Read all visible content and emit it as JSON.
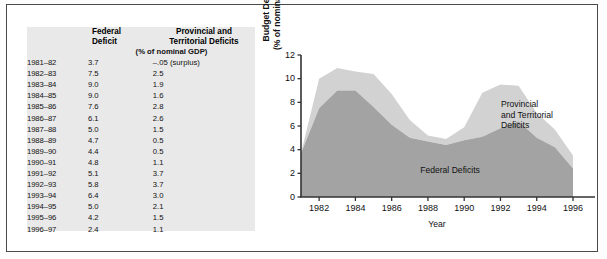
{
  "table": {
    "headers": {
      "year": "",
      "federal": "Federal\nDeficit",
      "provincial": "Provincial and\nTerritorial Deficits",
      "units": "(% of nominal GDP)"
    },
    "rows": [
      {
        "year": "1981–82",
        "federal": "3.7",
        "provincial": "–.05 (surplus)"
      },
      {
        "year": "1982–83",
        "federal": "7.5",
        "provincial": "2.5"
      },
      {
        "year": "1983–84",
        "federal": "9.0",
        "provincial": "1.9"
      },
      {
        "year": "1984–85",
        "federal": "9.0",
        "provincial": "1.6"
      },
      {
        "year": "1985–86",
        "federal": "7.6",
        "provincial": "2.8"
      },
      {
        "year": "1986–87",
        "federal": "6.1",
        "provincial": "2.6"
      },
      {
        "year": "1987–88",
        "federal": "5.0",
        "provincial": "1.5"
      },
      {
        "year": "1988–89",
        "federal": "4.7",
        "provincial": "0.5"
      },
      {
        "year": "1989–90",
        "federal": "4.4",
        "provincial": "0.5"
      },
      {
        "year": "1990–91",
        "federal": "4.8",
        "provincial": "1.1"
      },
      {
        "year": "1991–92",
        "federal": "5.1",
        "provincial": "3.7"
      },
      {
        "year": "1992–93",
        "federal": "5.8",
        "provincial": "3.7"
      },
      {
        "year": "1993–94",
        "federal": "6.4",
        "provincial": "3.0"
      },
      {
        "year": "1994–95",
        "federal": "5.0",
        "provincial": "2.1"
      },
      {
        "year": "1995–96",
        "federal": "4.2",
        "provincial": "1.5"
      },
      {
        "year": "1996–97",
        "federal": "2.4",
        "provincial": "1.1"
      }
    ]
  },
  "chart_data": {
    "type": "area",
    "stacked": true,
    "title": "",
    "xlabel": "Year",
    "ylabel": "Budget Deficits\n(% of nominal GDP)",
    "x": [
      1981,
      1982,
      1983,
      1984,
      1985,
      1986,
      1987,
      1988,
      1989,
      1990,
      1991,
      1992,
      1993,
      1994,
      1995,
      1996
    ],
    "xlim": [
      1981,
      1996
    ],
    "ylim": [
      0,
      12
    ],
    "yticks": [
      0,
      2,
      4,
      6,
      8,
      10,
      12
    ],
    "xticks": [
      1982,
      1984,
      1986,
      1988,
      1990,
      1992,
      1994,
      1996
    ],
    "grid": false,
    "legend_position": "inline-annotations",
    "series": [
      {
        "name": "Federal Deficits",
        "color": "#a3a3a3",
        "values": [
          3.7,
          7.5,
          9.0,
          9.0,
          7.6,
          6.1,
          5.0,
          4.7,
          4.4,
          4.8,
          5.1,
          5.8,
          6.4,
          5.0,
          4.2,
          2.4
        ]
      },
      {
        "name": "Provincial and Territorial Deficits",
        "color": "#d2d2d2",
        "values": [
          -0.05,
          2.5,
          1.9,
          1.6,
          2.8,
          2.6,
          1.5,
          0.5,
          0.5,
          1.1,
          3.7,
          3.7,
          3.0,
          2.1,
          1.5,
          1.1
        ]
      }
    ],
    "annotations": [
      {
        "text": "Provincial\nand Territorial\nDeficits",
        "series": "Provincial and Territorial Deficits"
      },
      {
        "text": "Federal Deficits",
        "series": "Federal Deficits"
      }
    ],
    "axis_color": "#333333"
  }
}
